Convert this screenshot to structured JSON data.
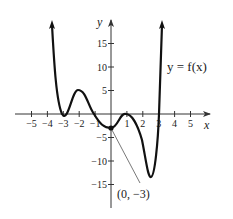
{
  "chart_data": {
    "type": "line",
    "title": "",
    "xlabel": "x",
    "ylabel": "y",
    "xlim": [
      -5.5,
      5.5
    ],
    "ylim": [
      -19,
      20
    ],
    "grid": false,
    "x_ticks": [
      -5,
      -4,
      -3,
      -2,
      -1,
      1,
      2,
      3,
      4,
      5
    ],
    "x_tick_labels": [
      "−5",
      "−4",
      "−3",
      "−2",
      "−1",
      "1",
      "2",
      "3",
      "4",
      "5"
    ],
    "y_ticks": [
      15,
      10,
      5,
      -5,
      -10,
      -15
    ],
    "y_tick_labels": [
      "15",
      "10",
      "5",
      "−5",
      "−10",
      "−15"
    ],
    "series": [
      {
        "name": "y = f(x)",
        "points": [
          {
            "x": -3.5,
            "y": 19
          },
          {
            "x": -3,
            "y": 0
          },
          {
            "x": -2,
            "y": 5
          },
          {
            "x": -1,
            "y": 0
          },
          {
            "x": 0,
            "y": -3
          },
          {
            "x": 1,
            "y": 0
          },
          {
            "x": 2.5,
            "y": -13.5
          },
          {
            "x": 3,
            "y": 0
          },
          {
            "x": 3.05,
            "y": 19
          }
        ]
      }
    ],
    "annotations": [
      {
        "text": "y = f(x)",
        "position": "upper right"
      },
      {
        "text": "(0, −3)",
        "point": {
          "x": 0,
          "y": -3
        }
      }
    ]
  },
  "labels": {
    "x_var": "x",
    "y_var": "y",
    "function": "y = f(x)",
    "point": "(0, −3)"
  }
}
